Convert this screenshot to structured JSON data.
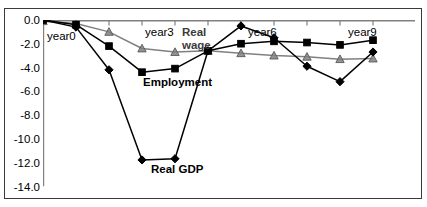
{
  "chart_data": {
    "type": "line",
    "title": "",
    "xlabel": "",
    "ylabel": "",
    "ylim": [
      -14.0,
      0.0
    ],
    "ytick_labels": [
      "0.0",
      "-2.0",
      "-4.0",
      "-6.0",
      "-8.0",
      "-10.0",
      "-12.0",
      "-14.0"
    ],
    "ytick_values": [
      0.0,
      -2.0,
      -4.0,
      -6.0,
      -8.0,
      -10.0,
      -12.0,
      -14.0
    ],
    "grid": false,
    "legend_position": "inline-annotations",
    "x": [
      0,
      1,
      2,
      3,
      4,
      5,
      6,
      7,
      8,
      9,
      10
    ],
    "x_annotations": [
      {
        "label": "year0",
        "x": 0
      },
      {
        "label": "year3",
        "x": 3
      },
      {
        "label": "year6",
        "x": 6
      },
      {
        "label": "year9",
        "x": 9
      }
    ],
    "series": [
      {
        "name": "Real GDP",
        "marker": "diamond",
        "color": "#000000",
        "values": [
          0.0,
          -0.6,
          -4.2,
          -11.8,
          -11.7,
          -2.6,
          -0.5,
          -1.5,
          -3.9,
          -5.2,
          -2.7
        ]
      },
      {
        "name": "Employment",
        "marker": "square",
        "color": "#000000",
        "values": [
          0.0,
          -0.4,
          -2.2,
          -4.4,
          -4.1,
          -2.6,
          -2.0,
          -1.8,
          -1.9,
          -2.1,
          -1.7
        ]
      },
      {
        "name": "Real wage",
        "marker": "triangle",
        "color": "#808080",
        "values": [
          -0.1,
          -0.3,
          -1.0,
          -2.4,
          -2.7,
          -2.6,
          -2.8,
          -3.0,
          -3.1,
          -3.3,
          -3.25
        ]
      }
    ],
    "annotations": [
      {
        "text": "year0",
        "x_px": 47,
        "y_px": 36
      },
      {
        "text": "year3",
        "x_px": 145,
        "y_px": 31
      },
      {
        "text": "Real",
        "x_px": 182,
        "y_px": 31
      },
      {
        "text": "wage",
        "x_px": 182,
        "y_px": 44
      },
      {
        "text": "year6",
        "x_px": 248,
        "y_px": 31
      },
      {
        "text": "year9",
        "x_px": 348,
        "y_px": 31
      },
      {
        "text": "Employment",
        "x_px": 143,
        "y_px": 81
      },
      {
        "text": "Real GDP",
        "x_px": 151,
        "y_px": 168
      }
    ]
  },
  "colors": {
    "frame": "#3a3a3a",
    "axis": "#808080",
    "real_gdp": "#000000",
    "employment": "#000000",
    "real_wage": "#808080",
    "background": "#ffffff"
  }
}
